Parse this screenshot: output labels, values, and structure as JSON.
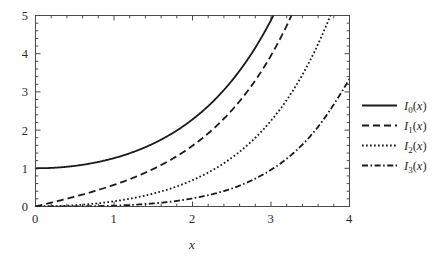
{
  "chart_data": {
    "type": "line",
    "title": "",
    "subtitle": "",
    "xlabel": "x",
    "ylabel": "",
    "xlim": [
      0,
      4
    ],
    "ylim": [
      0,
      5
    ],
    "grid": false,
    "legend_position": "right",
    "x_ticks": [
      "0",
      "1",
      "2",
      "3",
      "4"
    ],
    "x_tick_values": [
      0,
      1,
      2,
      3,
      4
    ],
    "y_ticks": [
      "0",
      "1",
      "2",
      "3",
      "4",
      "5"
    ],
    "y_tick_values": [
      0,
      1,
      2,
      3,
      4,
      5
    ],
    "minor_ticks_per_interval": 4,
    "x": [
      0,
      0.2,
      0.4,
      0.6,
      0.8,
      1.0,
      1.2,
      1.4,
      1.6,
      1.8,
      2.0,
      2.2,
      2.4,
      2.6,
      2.8,
      3.0,
      3.2,
      3.4,
      3.6,
      3.8,
      4.0
    ],
    "series": [
      {
        "name": "I_0(x)",
        "label_base": "I",
        "label_sub": "0",
        "label_arg": "(x)",
        "style": "solid",
        "color": "#1a1a1a",
        "values": [
          1.0,
          1.01,
          1.0404,
          1.092,
          1.1665,
          1.2661,
          1.3937,
          1.5534,
          1.75,
          1.9896,
          2.2796,
          2.6291,
          3.0493,
          3.5533,
          4.1573,
          4.8808,
          5.7472,
          6.7848,
          8.0277,
          9.5169,
          11.3019
        ],
        "exits_top_at_x": 3.05
      },
      {
        "name": "I_1(x)",
        "label_base": "I",
        "label_sub": "1",
        "label_arg": "(x)",
        "style": "dashed",
        "color": "#1a1a1a",
        "values": [
          0.0,
          0.1005,
          0.204,
          0.3137,
          0.4329,
          0.5652,
          0.7147,
          0.8861,
          1.0848,
          1.3172,
          1.5906,
          1.9141,
          2.2981,
          2.7554,
          3.3011,
          3.9534,
          4.7343,
          5.6701,
          6.7927,
          8.1404,
          9.7595
        ],
        "exits_top_at_x": 3.3
      },
      {
        "name": "I_2(x)",
        "label_base": "I",
        "label_sub": "2",
        "label_arg": "(x)",
        "style": "dotted",
        "color": "#1a1a1a",
        "values": [
          0.0,
          0.005,
          0.0203,
          0.0464,
          0.0843,
          0.1357,
          0.2026,
          0.2875,
          0.394,
          0.526,
          0.689,
          0.8891,
          1.1342,
          1.4337,
          1.7994,
          2.2452,
          2.7883,
          3.4495,
          4.254,
          5.2325,
          6.4222
        ],
        "exits_top_at_x": 3.8
      },
      {
        "name": "I_3(x)",
        "label_base": "I",
        "label_sub": "3",
        "label_arg": "(x)",
        "style": "dashdot",
        "color": "#1a1a1a",
        "values": [
          0.0,
          0.000167,
          0.00135,
          0.0046,
          0.0111,
          0.02217,
          0.0393,
          0.06422,
          0.09885,
          0.14544,
          0.2127,
          0.2958,
          0.4041,
          0.5459,
          0.731,
          0.9598,
          1.2512,
          1.6201,
          2.0855,
          2.6713,
          3.3373
        ],
        "end_value_at_x4": 3.34
      }
    ]
  },
  "legend": {
    "entries": [
      {
        "line_style": "solid",
        "text": "I₀(x)"
      },
      {
        "line_style": "dashed",
        "text": "I₁(x)"
      },
      {
        "line_style": "dotted",
        "text": "I₂(x)"
      },
      {
        "line_style": "dashdot",
        "text": "I₃(x)"
      }
    ]
  },
  "axes": {
    "x_label": "x",
    "x_tick_0": "0",
    "x_tick_1": "1",
    "x_tick_2": "2",
    "x_tick_3": "3",
    "x_tick_4": "4",
    "y_tick_0": "0",
    "y_tick_1": "1",
    "y_tick_2": "2",
    "y_tick_3": "3",
    "y_tick_4": "4",
    "y_tick_5": "5"
  },
  "colors": {
    "curve": "#1a1a1a",
    "frame": "#4a4a4a",
    "background": "#ffffff"
  }
}
